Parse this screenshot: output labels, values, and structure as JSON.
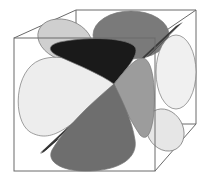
{
  "diagram": {
    "type": "3d-orbital-lobes-in-cube",
    "colors": {
      "background": "#ffffff",
      "cube_edge": "#6a6a6a",
      "lobe_light": "#ececec",
      "lobe_light_gray": "#cfcfcf",
      "lobe_mid_gray": "#9a9a9a",
      "lobe_dark_gray": "#6e6e6e",
      "lobe_black": "#1a1a1a",
      "nodal_plane": "#3a3a3a"
    },
    "cube": {
      "front_face": {
        "x1": 14,
        "y1": 38,
        "x2": 155,
        "y2": 171
      },
      "back_face": {
        "x1": 76,
        "y1": 10,
        "x2": 196,
        "y2": 124
      }
    },
    "center": {
      "x": 114,
      "y": 84
    },
    "lobe_count": 8
  }
}
